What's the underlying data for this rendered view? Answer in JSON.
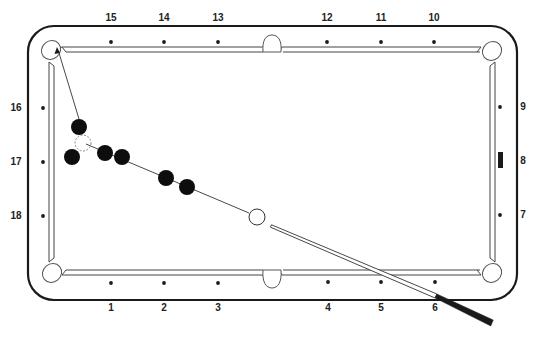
{
  "diagram": {
    "colors": {
      "ink": "#1a1a1a",
      "rail_line": "#555555",
      "background": "#ffffff",
      "ball_fill": "#0d0d0d",
      "cue_ball_fill": "#ffffff",
      "ghost_ball_stroke": "#888888"
    },
    "table": {
      "outer_frame": {
        "x": 28,
        "y": 26,
        "width": 489,
        "height": 274,
        "corner_radius": 26
      },
      "playing_surface": {
        "x": 54,
        "y": 53,
        "width": 436,
        "height": 218
      },
      "pockets": [
        {
          "name": "top-left-corner",
          "cx": 51,
          "cy": 50
        },
        {
          "name": "top-side",
          "cx": 272,
          "cy": 44
        },
        {
          "name": "top-right-corner",
          "cx": 492,
          "cy": 51
        },
        {
          "name": "bottom-left-corner",
          "cx": 52,
          "cy": 273
        },
        {
          "name": "bottom-side",
          "cx": 272,
          "cy": 279
        },
        {
          "name": "bottom-right-corner",
          "cx": 492,
          "cy": 273
        }
      ]
    },
    "diamond_labels": {
      "top": [
        {
          "text": "15",
          "x": 111,
          "y": 18
        },
        {
          "text": "14",
          "x": 164,
          "y": 18
        },
        {
          "text": "13",
          "x": 218,
          "y": 18
        },
        {
          "text": "12",
          "x": 327,
          "y": 18
        },
        {
          "text": "11",
          "x": 381,
          "y": 18
        },
        {
          "text": "10",
          "x": 434,
          "y": 18
        }
      ],
      "bottom": [
        {
          "text": "1",
          "x": 111,
          "y": 308
        },
        {
          "text": "2",
          "x": 164,
          "y": 308
        },
        {
          "text": "3",
          "x": 218,
          "y": 308
        },
        {
          "text": "4",
          "x": 328,
          "y": 308
        },
        {
          "text": "5",
          "x": 381,
          "y": 308
        },
        {
          "text": "6",
          "x": 435,
          "y": 308
        }
      ],
      "left": [
        {
          "text": "16",
          "x": 16,
          "y": 108
        },
        {
          "text": "17",
          "x": 16,
          "y": 162
        },
        {
          "text": "18",
          "x": 16,
          "y": 216
        }
      ],
      "right": [
        {
          "text": "9",
          "x": 523,
          "y": 107
        },
        {
          "text": "8",
          "x": 523,
          "y": 161
        },
        {
          "text": "7",
          "x": 523,
          "y": 215
        }
      ]
    },
    "diamond_markers": {
      "top": [
        {
          "x": 111,
          "y": 42
        },
        {
          "x": 164,
          "y": 42
        },
        {
          "x": 218,
          "y": 42
        },
        {
          "x": 327,
          "y": 42
        },
        {
          "x": 381,
          "y": 42
        },
        {
          "x": 434,
          "y": 42
        }
      ],
      "bottom": [
        {
          "x": 111,
          "y": 283
        },
        {
          "x": 164,
          "y": 283
        },
        {
          "x": 218,
          "y": 283
        },
        {
          "x": 328,
          "y": 282
        },
        {
          "x": 381,
          "y": 282
        },
        {
          "x": 435,
          "y": 282
        }
      ],
      "left": [
        {
          "x": 43,
          "y": 108
        },
        {
          "x": 43,
          "y": 162
        },
        {
          "x": 43,
          "y": 216
        }
      ],
      "right": [
        {
          "x": 500,
          "y": 107
        },
        {
          "x": 500,
          "y": 215
        }
      ],
      "right_bar_marker": {
        "x": 498,
        "y": 152,
        "width": 5,
        "height": 16,
        "label": "8"
      }
    },
    "balls": {
      "object_balls": [
        {
          "cx": 79,
          "cy": 127,
          "r": 8
        },
        {
          "cx": 72,
          "cy": 157,
          "r": 8
        },
        {
          "cx": 105,
          "cy": 153,
          "r": 8
        },
        {
          "cx": 122,
          "cy": 157,
          "r": 8
        },
        {
          "cx": 166,
          "cy": 178,
          "r": 8
        },
        {
          "cx": 187,
          "cy": 187,
          "r": 8
        }
      ],
      "ghost_ball": {
        "cx": 83,
        "cy": 143,
        "r": 8,
        "style": "dashed"
      },
      "cue_ball": {
        "cx": 257,
        "cy": 217,
        "r": 8
      }
    },
    "paths": {
      "aim_line_to_pocket": {
        "x1": 79,
        "y1": 119,
        "x2": 59,
        "y2": 53
      },
      "arrow_head": {
        "tip_x": 57,
        "tip_y": 47
      },
      "cue_ball_path": {
        "x1": 249,
        "y1": 213,
        "x2": 86,
        "y2": 144
      }
    },
    "cue_stick": {
      "shaft_start": {
        "x": 271,
        "y": 226
      },
      "shaft_end": {
        "x": 436,
        "y": 296
      },
      "butt_end": {
        "x": 492,
        "y": 323
      }
    }
  }
}
